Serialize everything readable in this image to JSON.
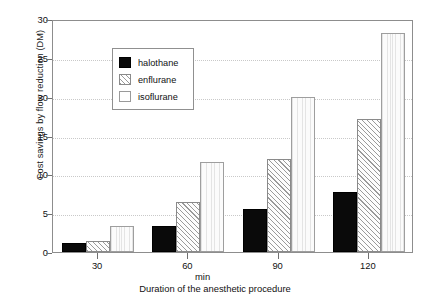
{
  "chart_data": {
    "type": "bar",
    "title": "",
    "subtitle": "",
    "xlabel": "Duration of the anesthetic procedure",
    "x_unit_label": "min",
    "ylabel": "Cost savings by flow reduction (DM)",
    "categories": [
      "30",
      "60",
      "90",
      "120"
    ],
    "ylim": [
      0,
      30
    ],
    "yticks": [
      0,
      5,
      10,
      15,
      20,
      25,
      30
    ],
    "ytick_labels": [
      "0",
      "5",
      "10",
      "15",
      "20",
      "25",
      "30"
    ],
    "grid": "horizontal-dotted",
    "legend_position": "top-left-inside",
    "series": [
      {
        "name": "halothane",
        "fill": "solid-black",
        "color": "#0a0a0a",
        "values": [
          1.1,
          3.3,
          5.6,
          7.7
        ]
      },
      {
        "name": "enflurane",
        "fill": "diagonal-hatch",
        "color": "#9a9a9a",
        "values": [
          1.4,
          6.5,
          12.0,
          17.1
        ]
      },
      {
        "name": "isoflurane",
        "fill": "light-vertical-lines",
        "color": "#e4e4e4",
        "values": [
          3.4,
          11.6,
          20.0,
          28.2
        ]
      }
    ]
  },
  "legend": {
    "entries": [
      "halothane",
      "enflurane",
      "isoflurane"
    ]
  }
}
